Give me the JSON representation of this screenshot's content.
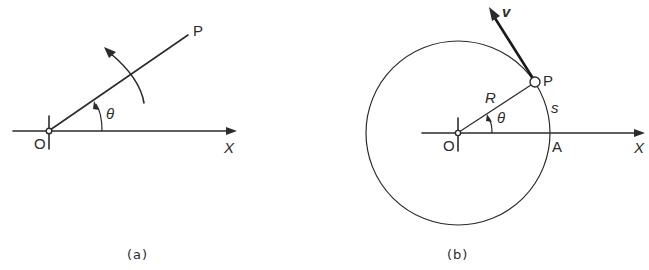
{
  "figure": {
    "panels": [
      {
        "id": "a",
        "caption": "(a)",
        "labels": {
          "origin": "O",
          "point": "P",
          "axis": "X",
          "angle": "θ"
        }
      },
      {
        "id": "b",
        "caption": "(b)",
        "labels": {
          "origin": "O",
          "point": "P",
          "axis": "X",
          "angle": "θ",
          "radius": "R",
          "arc_length": "s",
          "axis_intersection": "A",
          "velocity": "v"
        }
      }
    ],
    "colors": {
      "ink": "#2b2b2b",
      "background": "#ffffff"
    }
  }
}
